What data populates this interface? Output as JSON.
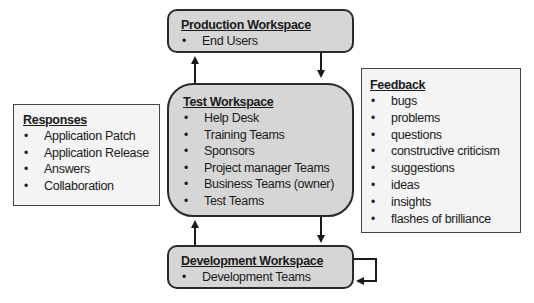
{
  "production": {
    "title": "Production Workspace",
    "items": [
      "End Users"
    ]
  },
  "test": {
    "title": "Test Workspace",
    "items": [
      "Help Desk",
      "Training Teams",
      "Sponsors",
      "Project manager Teams",
      "Business Teams (owner)",
      "Test Teams"
    ]
  },
  "development": {
    "title": "Development Workspace",
    "items": [
      "Development Teams"
    ]
  },
  "responses": {
    "title": "Responses",
    "items": [
      "Application Patch",
      "Application Release",
      "Answers",
      "Collaboration"
    ]
  },
  "feedback": {
    "title": "Feedback",
    "items": [
      "bugs",
      "problems",
      "questions",
      "constructive criticism",
      "suggestions",
      "ideas",
      "insights",
      "flashes of brilliance"
    ]
  }
}
